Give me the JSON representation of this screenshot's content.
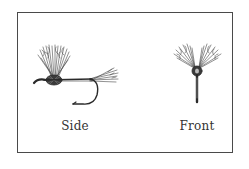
{
  "figure": {
    "views": [
      {
        "id": "side",
        "label": "Side"
      },
      {
        "id": "front",
        "label": "Front"
      }
    ]
  },
  "colors": {
    "border": "#4a4a4a",
    "ink": "#2a2a2a",
    "caption": "#333333",
    "background": "#ffffff"
  }
}
